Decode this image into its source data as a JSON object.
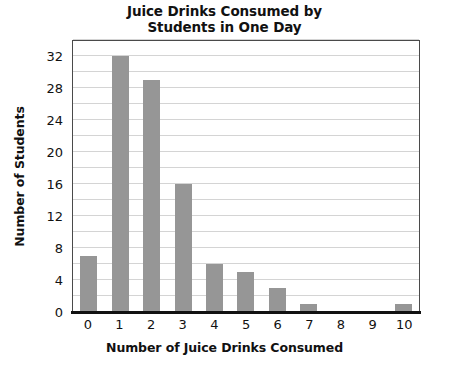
{
  "chart_data": {
    "type": "bar",
    "title": "Juice Drinks Consumed by Students in One Day",
    "title_lines": [
      "Juice Drinks Consumed by",
      "Students in One Day"
    ],
    "xlabel": "Number of Juice Drinks Consumed",
    "ylabel": "Number of Students",
    "categories": [
      "0",
      "1",
      "2",
      "3",
      "4",
      "5",
      "6",
      "7",
      "8",
      "9",
      "10"
    ],
    "values": [
      7,
      32,
      29,
      16,
      6,
      5,
      3,
      1,
      0,
      0,
      1
    ],
    "ylim": [
      0,
      34
    ],
    "ytick_labels": [
      "0",
      "4",
      "8",
      "12",
      "16",
      "20",
      "24",
      "28",
      "32"
    ],
    "ytick_values": [
      0,
      4,
      8,
      12,
      16,
      20,
      24,
      28,
      32
    ],
    "gridline_values": [
      2,
      4,
      6,
      8,
      10,
      12,
      14,
      16,
      18,
      20,
      22,
      24,
      26,
      28,
      30,
      32,
      34
    ],
    "grid": true,
    "legend": null,
    "colors": {
      "bar": "#969696",
      "gridline": "#d4d4d4",
      "axis": "#111111",
      "frame": "#4a4a4a",
      "background": "#ffffff",
      "text": "#111111"
    }
  }
}
